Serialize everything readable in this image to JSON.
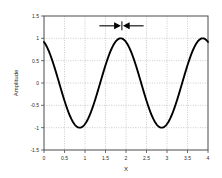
{
  "chart_data": {
    "type": "line",
    "title": "",
    "xlabel": "X",
    "ylabel": "Amplitude",
    "xlim": [
      0,
      4
    ],
    "ylim": [
      -1.5,
      1.5
    ],
    "grid": true,
    "legend": null,
    "xticks": [
      "0",
      "0.5",
      "1",
      "1.5",
      "2",
      "2.5",
      "3",
      "3.5",
      "4"
    ],
    "xtick_values": [
      0,
      0.5,
      1,
      1.5,
      2,
      2.5,
      3,
      3.5,
      4
    ],
    "yticks": [
      "1.5",
      "1",
      "0.5",
      "0",
      "-0.5",
      "-1",
      "-1.5"
    ],
    "ytick_values": [
      1.5,
      1,
      0.5,
      0,
      -0.5,
      -1,
      -1.5
    ],
    "series": [
      {
        "name": "waveform",
        "color": "#000000",
        "description": "cosine wave, amplitude 1, period 2, peaks at x=1.87 and x=3.87, troughs at x=0.87 and x=2.87",
        "amplitude": 1,
        "period": 2,
        "phase_peak_x": 1.87,
        "x": [
          0,
          0.1,
          0.2,
          0.3,
          0.4,
          0.5,
          0.6,
          0.7,
          0.8,
          0.87,
          1.0,
          1.1,
          1.2,
          1.3,
          1.4,
          1.5,
          1.6,
          1.7,
          1.8,
          1.87,
          2.0,
          2.1,
          2.2,
          2.3,
          2.4,
          2.5,
          2.6,
          2.7,
          2.8,
          2.87,
          3.0,
          3.1,
          3.2,
          3.3,
          3.4,
          3.5,
          3.6,
          3.7,
          3.8,
          3.87,
          4.0
        ],
        "y": [
          0.95,
          0.82,
          0.6,
          0.31,
          -0.03,
          -0.37,
          -0.66,
          -0.87,
          -0.98,
          -1.0,
          -0.92,
          -0.79,
          -0.59,
          -0.33,
          -0.05,
          0.28,
          0.59,
          0.82,
          0.97,
          1.0,
          0.95,
          0.82,
          0.6,
          0.31,
          -0.03,
          -0.37,
          -0.66,
          -0.87,
          -0.98,
          -1.0,
          -0.92,
          -0.79,
          -0.59,
          -0.33,
          -0.05,
          0.28,
          0.59,
          0.82,
          0.97,
          1.0,
          0.95
        ]
      }
    ],
    "annotations": [
      {
        "name": "interval-marker",
        "type": "double-headed-arrow",
        "y_value": 1.28,
        "x_start": 1.35,
        "x_end": 2.43,
        "x_center": 1.9,
        "label": ""
      }
    ]
  }
}
